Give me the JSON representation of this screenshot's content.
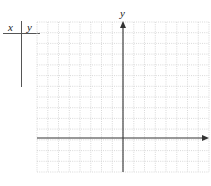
{
  "table": {
    "col_x_label": "x",
    "col_y_label": "y"
  },
  "graph": {
    "y_axis_label": "y",
    "grid_columns": 16,
    "grid_rows": 14,
    "y_axis_column_index": 8,
    "x_axis_row_index": 11
  },
  "colors": {
    "axis": "#333333",
    "grid": "#c8c8c8",
    "table_line": "#555555"
  }
}
